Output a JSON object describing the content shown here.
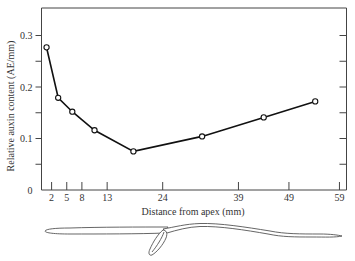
{
  "chart_data": {
    "type": "line",
    "title": "",
    "xlabel": "Distance from apex (mm)",
    "ylabel": "Relative auxin content (AE/mm)",
    "x": [
      1.0,
      3.3,
      6.1,
      10.5,
      18.2,
      31.8,
      44.0,
      54.2
    ],
    "series": [
      {
        "name": "Relative auxin content",
        "values": [
          0.277,
          0.179,
          0.152,
          0.116,
          0.075,
          0.104,
          0.141,
          0.172
        ]
      }
    ],
    "xticks": [
      2,
      5,
      8,
      13,
      24,
      39,
      49,
      59
    ],
    "yticks": [
      0,
      0.1,
      0.2,
      0.3
    ],
    "yticks_minor": [
      0.05,
      0.15,
      0.25
    ],
    "xlim": [
      0,
      60.5
    ],
    "ylim": [
      0,
      0.35
    ],
    "grid": false,
    "legend": "none",
    "markers": "open circles",
    "annotation": "Drawing of a seedling root/coleoptile aligned beneath the distance axis"
  },
  "labels": {
    "x_axis_title": "Distance from apex (mm)",
    "y_axis_title": "Relative auxin content (AE/mm)",
    "y_tick_labels": [
      "0",
      "0.1",
      "0.2",
      "0.3"
    ],
    "x_tick_labels": [
      "2",
      "5",
      "8",
      "13",
      "24",
      "39",
      "49",
      "59"
    ]
  }
}
